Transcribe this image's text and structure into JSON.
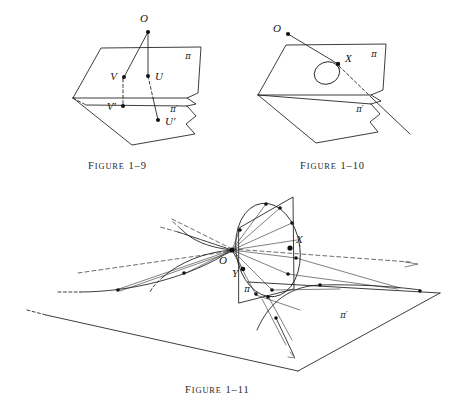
{
  "page": {
    "background_color": "#ffffff",
    "ink_color": "#1b1b1b",
    "width": 462,
    "height": 409
  },
  "captions": {
    "figure_1_9": {
      "word": "Figure",
      "number": "1–9"
    },
    "figure_1_10": {
      "word": "Figure",
      "number": "1–10"
    },
    "figure_1_11": {
      "word": "Figure",
      "number": "1–11"
    }
  },
  "figures": [
    {
      "id": "figure-1-9",
      "caption_word": "Figure",
      "caption_number": "1–9",
      "labels": {
        "center": "O",
        "point_v": "V",
        "point_u": "U",
        "point_v_prime": "V′",
        "point_u_prime": "U′",
        "plane_pi": "π",
        "plane_pi_prime": "π′"
      },
      "points": [
        {
          "name": "O",
          "label": "O",
          "x": 148,
          "y": 32
        },
        {
          "name": "V",
          "label": "V",
          "x": 124,
          "y": 77
        },
        {
          "name": "U",
          "label": "U",
          "x": 148,
          "y": 76
        },
        {
          "name": "V-prime",
          "label": "V′",
          "x": 123,
          "y": 106
        },
        {
          "name": "U-prime",
          "label": "U′",
          "x": 158,
          "y": 120
        }
      ]
    },
    {
      "id": "figure-1-10",
      "caption_word": "Figure",
      "caption_number": "1–10",
      "labels": {
        "center": "O",
        "point_x": "X",
        "plane_pi": "π",
        "plane_pi_prime": "π′"
      },
      "points": [
        {
          "name": "O",
          "label": "O",
          "x": 284,
          "y": 33
        },
        {
          "name": "X",
          "label": "X",
          "x": 338,
          "y": 64
        }
      ]
    },
    {
      "id": "figure-1-11",
      "caption_word": "Figure",
      "caption_number": "1–11",
      "labels": {
        "center": "O",
        "point_x": "X",
        "point_y": "Y",
        "plane_pi": "π",
        "plane_pi_prime": "π′"
      },
      "points": [
        {
          "name": "O",
          "label": "O",
          "x": 230,
          "y": 249
        },
        {
          "name": "X",
          "label": "X",
          "x": 290,
          "y": 245
        },
        {
          "name": "Y",
          "label": "Y",
          "x": 243,
          "y": 269
        }
      ]
    }
  ]
}
